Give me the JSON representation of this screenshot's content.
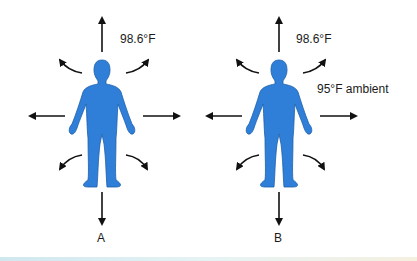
{
  "figure": {
    "panels": [
      {
        "id": "A",
        "label": "A",
        "temp_label": "98.6°F",
        "ambient_label": ""
      },
      {
        "id": "B",
        "label": "B",
        "temp_label": "98.6°F",
        "ambient_label": "95°F ambient"
      }
    ],
    "colors": {
      "body": "#2f7fd9",
      "body_outline": "#1d5fa8",
      "arrow": "#111111"
    }
  }
}
